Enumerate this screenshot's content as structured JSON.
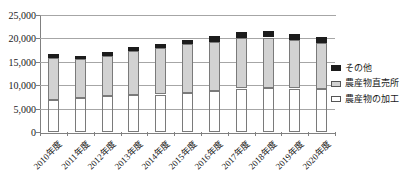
{
  "chart_data": {
    "type": "bar",
    "stacked": true,
    "title": "",
    "xlabel": "",
    "ylabel": "",
    "ylim": [
      0,
      25000
    ],
    "ytick_step": 5000,
    "ytick_labels": [
      "0",
      "5,000",
      "10,000",
      "15,000",
      "20,000",
      "25,000"
    ],
    "grid": true,
    "legend_position": "right",
    "categories": [
      "2010年度",
      "2011年度",
      "2012年度",
      "2013年度",
      "2014年度",
      "2015年度",
      "2016年度",
      "2017年度",
      "2018年度",
      "2019年度",
      "2020年度"
    ],
    "stack_order": "bottom-to-top",
    "series": [
      {
        "name": "農産物の加工",
        "color": "#ffffff",
        "values": [
          6800,
          7200,
          7700,
          7900,
          8000,
          8400,
          8800,
          9300,
          9400,
          9300,
          9100
        ]
      },
      {
        "name": "農産物直売所",
        "color": "#d2d2d2",
        "values": [
          9000,
          8400,
          8500,
          9400,
          9900,
          10400,
          10500,
          10800,
          10800,
          10300,
          9900
        ]
      },
      {
        "name": "その他",
        "color": "#1c1c1c",
        "values": [
          800,
          700,
          800,
          900,
          900,
          900,
          1200,
          1300,
          1300,
          1300,
          1300
        ]
      }
    ],
    "totals": [
      16600,
      16300,
      17000,
      18200,
      18800,
      19700,
      20500,
      21400,
      21500,
      20900,
      20300
    ],
    "legend": [
      {
        "label": "その他",
        "color": "#1c1c1c",
        "border": "#1c1c1c"
      },
      {
        "label": "農産物直売所",
        "color": "#d2d2d2",
        "border": "#555555"
      },
      {
        "label": "農産物の加工",
        "color": "#ffffff",
        "border": "#555555"
      }
    ]
  },
  "colors": {
    "gridline": "#a6a6a6",
    "axis": "#808080",
    "text": "#1a1a1a",
    "background": "#ffffff"
  }
}
